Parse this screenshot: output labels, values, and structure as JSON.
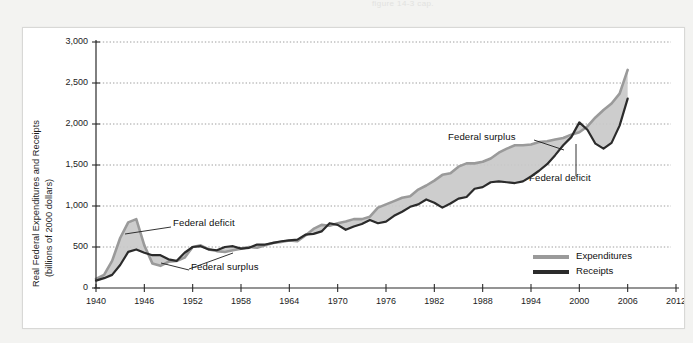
{
  "page": {
    "bleed_text": "figure 14-3 cap."
  },
  "chart_data": {
    "type": "area",
    "title": "",
    "xlabel": "Year",
    "ylabel": "Real Federal Expenditures and Receipts (billions of 2000 dollars)",
    "ylabel_line1": "Real Federal Expenditures and Receipts",
    "ylabel_line2": "(billions of 2000 dollars)",
    "xlim": [
      1940,
      2012
    ],
    "ylim": [
      0,
      3000
    ],
    "xticks": [
      1940,
      1946,
      1952,
      1958,
      1964,
      1970,
      1976,
      1982,
      1988,
      1994,
      2000,
      2006,
      2012
    ],
    "yticks": [
      0,
      500,
      1000,
      1500,
      2000,
      2500,
      3000
    ],
    "ytick_labels": [
      "0",
      "500",
      "1,000",
      "1,500",
      "2,000",
      "2,500",
      "3,000"
    ],
    "xtick_labels": [
      "1940",
      "1946",
      "1952",
      "1958",
      "1964",
      "1970",
      "1976",
      "1982",
      "1988",
      "1994",
      "2000",
      "2006",
      "2012"
    ],
    "grid": "horizontal-dotted",
    "legend_position": "inside-bottom-right",
    "colors": {
      "expenditures": "#9a9a9a",
      "receipts": "#2b2b2b",
      "gap_fill": "#c9c9c9",
      "grid": "#9e9e9e",
      "axis": "#2b2b2b",
      "text": "#101010"
    },
    "x": [
      1940,
      1941,
      1942,
      1943,
      1944,
      1945,
      1946,
      1947,
      1948,
      1949,
      1950,
      1951,
      1952,
      1953,
      1954,
      1955,
      1956,
      1957,
      1958,
      1959,
      1960,
      1961,
      1962,
      1963,
      1964,
      1965,
      1966,
      1967,
      1968,
      1969,
      1970,
      1971,
      1972,
      1973,
      1974,
      1975,
      1976,
      1977,
      1978,
      1979,
      1980,
      1981,
      1982,
      1983,
      1984,
      1985,
      1986,
      1987,
      1988,
      1989,
      1990,
      1991,
      1992,
      1993,
      1994,
      1995,
      1996,
      1997,
      1998,
      1999,
      2000,
      2001,
      2002,
      2003,
      2004,
      2005,
      2006
    ],
    "series": [
      {
        "name": "Expenditures",
        "color": "#9a9a9a",
        "values": [
          110,
          160,
          330,
          610,
          800,
          840,
          520,
          300,
          270,
          320,
          330,
          370,
          500,
          520,
          470,
          450,
          440,
          460,
          480,
          500,
          490,
          520,
          550,
          560,
          580,
          570,
          640,
          720,
          770,
          760,
          790,
          810,
          840,
          840,
          870,
          980,
          1020,
          1060,
          1100,
          1120,
          1200,
          1250,
          1310,
          1380,
          1400,
          1480,
          1520,
          1520,
          1540,
          1580,
          1650,
          1700,
          1740,
          1740,
          1750,
          1780,
          1790,
          1810,
          1830,
          1870,
          1900,
          1970,
          2080,
          2170,
          2250,
          2370,
          2660
        ]
      },
      {
        "name": "Receipts",
        "color": "#2b2b2b",
        "values": [
          90,
          120,
          160,
          280,
          440,
          470,
          430,
          400,
          400,
          350,
          330,
          430,
          500,
          510,
          470,
          460,
          500,
          510,
          480,
          490,
          530,
          530,
          550,
          570,
          580,
          590,
          650,
          660,
          690,
          790,
          770,
          710,
          750,
          780,
          830,
          790,
          810,
          880,
          930,
          990,
          1020,
          1080,
          1040,
          980,
          1030,
          1090,
          1110,
          1210,
          1230,
          1290,
          1300,
          1290,
          1280,
          1300,
          1360,
          1430,
          1510,
          1620,
          1740,
          1840,
          2020,
          1930,
          1760,
          1700,
          1770,
          1980,
          2310
        ]
      }
    ],
    "annotations": [
      {
        "id": "federal-deficit-left",
        "text": "Federal deficit",
        "label_x": 172,
        "label_y": 222,
        "leader": [
          [
            170,
            226
          ],
          [
            124,
            233
          ]
        ]
      },
      {
        "id": "federal-surplus-left",
        "text": "Federal surplus",
        "label_x": 190,
        "label_y": 266,
        "leader": [
          [
            188,
            269
          ],
          [
            160,
            262
          ]
        ]
      },
      {
        "id": "federal-surplus-left2",
        "text": "",
        "label_x": 0,
        "label_y": 0,
        "leader": [
          [
            188,
            268
          ],
          [
            232,
            252
          ]
        ]
      },
      {
        "id": "federal-surplus-right",
        "text": "Federal surplus",
        "label_x": 447,
        "label_y": 136,
        "leader": [
          [
            533,
            139
          ],
          [
            563,
            149
          ]
        ]
      },
      {
        "id": "federal-deficit-right",
        "text": "Federal deficit",
        "label_x": 528,
        "label_y": 177,
        "leader": [
          [
            575,
            175
          ],
          [
            575,
            143
          ]
        ]
      }
    ],
    "legend": [
      {
        "name": "Expenditures",
        "color": "#9a9a9a"
      },
      {
        "name": "Receipts",
        "color": "#2b2b2b"
      }
    ]
  }
}
